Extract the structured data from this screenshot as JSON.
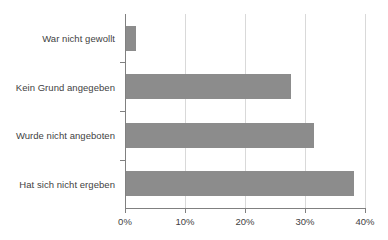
{
  "chart_data": {
    "type": "bar",
    "orientation": "horizontal",
    "title": "",
    "xlabel": "",
    "ylabel": "",
    "categories": [
      "War nicht gewollt",
      "Kein Grund angegeben",
      "Wurde nicht angeboten",
      "Hat sich nicht ergeben"
    ],
    "values": [
      1.7,
      27.5,
      31.3,
      38.0
    ],
    "value_suffix": "%",
    "xlim": [
      0,
      40
    ],
    "xticks": [
      0,
      10,
      20,
      30,
      40
    ],
    "xtick_labels": [
      "0%",
      "10%",
      "20%",
      "30%",
      "40%"
    ],
    "grid": "vertical",
    "legend": "none",
    "bar_color": "#8c8c8c",
    "gridline_color": "#d9d9d9",
    "axis_color": "#808080",
    "background_color": "#ffffff",
    "text_color": "#3f3f3f"
  }
}
